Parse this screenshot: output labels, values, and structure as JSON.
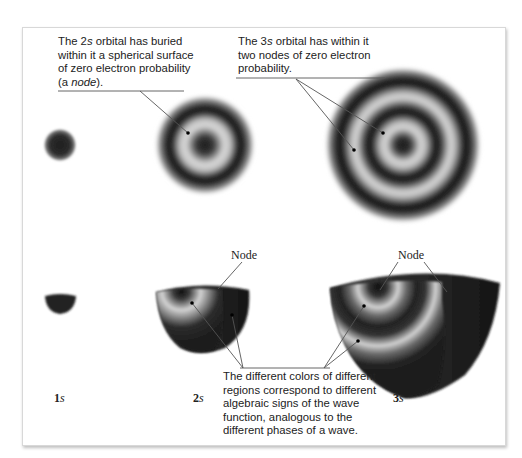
{
  "figure": {
    "cutoff_text": "ty of a      y       ",
    "captions": {
      "orbital_2s": {
        "line1_pre": "The 2",
        "line1_italic": "s",
        "line1_post": " orbital has buried",
        "line2": "within it a spherical surface",
        "line3": "of zero electron probability",
        "line4_pre": "(a ",
        "line4_italic": "node",
        "line4_post": ")."
      },
      "orbital_3s": {
        "line1_pre": "The 3",
        "line1_italic": "s",
        "line1_post": " orbital has within it",
        "line2": "two nodes of zero electron",
        "line3": "probability."
      },
      "colors_note": {
        "line1": "The different colors of different",
        "line2": "regions correspond to different",
        "line3": "algebraic signs of the wave",
        "line4": "function, analogous to the",
        "line5": "different phases of a wave."
      }
    },
    "node_labels": {
      "node_2s": "Node",
      "node_3s": "Node"
    },
    "orbital_labels": [
      {
        "num": "1",
        "letter": "s"
      },
      {
        "num": "2",
        "letter": "s"
      },
      {
        "num": "3",
        "letter": "s"
      }
    ],
    "colors": {
      "orbital_dark": "#1a1a1a",
      "orbital_light": "#d4d4d4",
      "leader_line": "#555555",
      "frame_border": "#d8d8d8"
    }
  }
}
